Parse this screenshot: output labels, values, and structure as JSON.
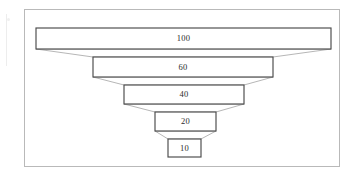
{
  "diagram": {
    "type": "funnel",
    "title": "",
    "background_color": "#ffffff",
    "frame": {
      "name": "diagram-frame",
      "border_color": "#b9b9b9",
      "fill_color": "#ffffff"
    },
    "style": {
      "bar_stroke_color": "#4a4a4a",
      "bar_fill_color": "#ffffff",
      "connector_stroke_color": "#9d9d9d",
      "label_color": "#2b2b2b"
    },
    "stages": [
      {
        "label": "100",
        "value": 100,
        "name": "funnel-stage-1",
        "x": 36,
        "y": 28,
        "width": 295,
        "height": 21
      },
      {
        "label": "60",
        "value": 60,
        "name": "funnel-stage-2",
        "x": 93,
        "y": 57,
        "width": 180,
        "height": 20
      },
      {
        "label": "40",
        "value": 40,
        "name": "funnel-stage-3",
        "x": 124,
        "y": 85,
        "width": 120,
        "height": 19
      },
      {
        "label": "20",
        "value": 20,
        "name": "funnel-stage-4",
        "x": 155,
        "y": 112,
        "width": 61,
        "height": 19
      },
      {
        "label": "10",
        "value": 10,
        "name": "funnel-stage-5",
        "x": 168,
        "y": 139,
        "width": 33,
        "height": 18
      }
    ]
  },
  "chart_data": {
    "type": "bar",
    "chart_kind": "funnel",
    "title": "",
    "subtitle": "",
    "xlabel": "",
    "ylabel": "",
    "categories": [
      "100",
      "60",
      "40",
      "20",
      "10"
    ],
    "values": [
      100,
      60,
      40,
      20,
      10
    ],
    "data_labels": [
      "100",
      "60",
      "40",
      "20",
      "10"
    ],
    "grid": false,
    "legend": "none",
    "orientation": "vertical-funnel",
    "ylim": [
      0,
      100
    ],
    "annotations": []
  }
}
